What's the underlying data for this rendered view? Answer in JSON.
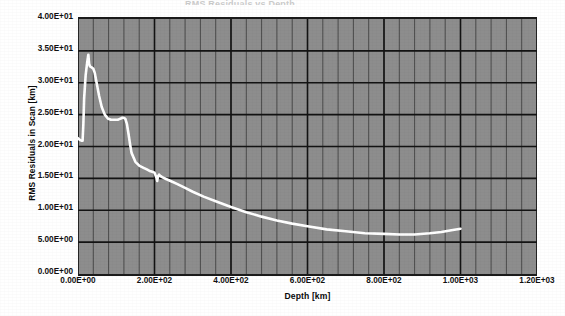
{
  "chart_data": {
    "type": "line",
    "title": "RMS Residuals vs Depth",
    "xlabel": "Depth [km]",
    "ylabel": "RMS Residuals in Scan [km]",
    "xlim": [
      0,
      1200
    ],
    "ylim": [
      0,
      40
    ],
    "grid": true,
    "legend": null,
    "x_ticks": [
      0,
      200,
      400,
      600,
      800,
      1000,
      1200
    ],
    "x_tick_labels": [
      "0.00E+00",
      "2.00E+02",
      "4.00E+02",
      "6.00E+02",
      "8.00E+02",
      "1.00E+03",
      "1.20E+03"
    ],
    "y_ticks": [
      0,
      5,
      10,
      15,
      20,
      25,
      30,
      35,
      40
    ],
    "y_tick_labels": [
      "0.00E+00",
      "5.00E+00",
      "1.00E+01",
      "1.50E+01",
      "2.00E+01",
      "2.50E+01",
      "3.00E+01",
      "3.50E+01",
      "4.00E+01"
    ],
    "x_minor_step": 40,
    "plot_bg_color": "#8d8d8d",
    "grid_color": "#1b1b1b",
    "line_color": "#ffffff",
    "series": [
      {
        "name": "RMS Residuals",
        "x": [
          0,
          6,
          10,
          12,
          14,
          16,
          20,
          24,
          27,
          29,
          31,
          33,
          36,
          40,
          44,
          48,
          55,
          62,
          70,
          78,
          86,
          94,
          100,
          104,
          108,
          112,
          116,
          120,
          124,
          128,
          132,
          136,
          140,
          150,
          160,
          170,
          180,
          186,
          190,
          196,
          200,
          205,
          207,
          209,
          212,
          215,
          220,
          230,
          245,
          260,
          280,
          300,
          330,
          360,
          400,
          440,
          480,
          520,
          560,
          600,
          650,
          700,
          750,
          800,
          840,
          880,
          920,
          950,
          980,
          1000
        ],
        "y": [
          21.3,
          21.0,
          20.9,
          20.9,
          23.5,
          27.5,
          31.2,
          33.2,
          34.4,
          33.0,
          32.6,
          32.5,
          32.4,
          32.2,
          31.5,
          30.2,
          28.0,
          26.2,
          25.0,
          24.4,
          24.2,
          24.2,
          24.2,
          24.2,
          24.3,
          24.4,
          24.5,
          24.5,
          24.3,
          23.5,
          22.0,
          20.4,
          19.0,
          17.6,
          17.0,
          16.7,
          16.4,
          16.2,
          16.1,
          16.0,
          15.9,
          15.1,
          14.6,
          15.3,
          15.6,
          15.4,
          15.2,
          14.9,
          14.5,
          14.1,
          13.5,
          12.9,
          12.1,
          11.4,
          10.5,
          9.7,
          9.0,
          8.4,
          7.9,
          7.5,
          7.0,
          6.7,
          6.4,
          6.3,
          6.2,
          6.2,
          6.4,
          6.6,
          6.9,
          7.1
        ]
      }
    ],
    "description": {
      "initial_value": 21.3,
      "peak_value": 34.4,
      "peak_depth": 27,
      "minimum_value": 6.2,
      "minimum_depth": 860,
      "final_value": 7.1,
      "final_depth": 1000
    }
  }
}
